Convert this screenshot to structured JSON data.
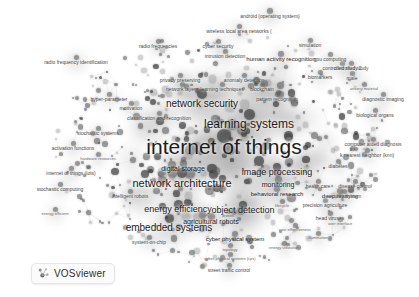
{
  "app": {
    "name": "VOSviewer",
    "logo_label": "VOSviewer",
    "logo_icon": "vosviewer-logo-icon",
    "background_color": "#ffffff",
    "node_color": "#5a5a5a",
    "label_color": "#1c1c1c"
  },
  "visualization": {
    "type": "term co-occurrence density network map",
    "layout": "force-directed cluster map",
    "colormap": "grayscale",
    "width": 419,
    "height": 297
  },
  "terms": [
    {
      "label": "internet of things",
      "x": 224,
      "y": 146,
      "size": 21,
      "weight": 100
    },
    {
      "label": "learning systems",
      "x": 249,
      "y": 124,
      "size": 12,
      "weight": 72
    },
    {
      "label": "network security",
      "x": 202,
      "y": 104,
      "size": 10,
      "weight": 60
    },
    {
      "label": "network architecture",
      "x": 182,
      "y": 183,
      "size": 11,
      "weight": 64
    },
    {
      "label": "embedded systems",
      "x": 169,
      "y": 228,
      "size": 10,
      "weight": 58
    },
    {
      "label": "energy efficiency",
      "x": 178,
      "y": 209,
      "size": 9,
      "weight": 52
    },
    {
      "label": "object detection",
      "x": 243,
      "y": 210,
      "size": 9,
      "weight": 50
    },
    {
      "label": "image processing",
      "x": 277,
      "y": 172,
      "size": 9,
      "weight": 49
    },
    {
      "label": "agricultural robots",
      "x": 211,
      "y": 221,
      "size": 7,
      "weight": 38
    },
    {
      "label": "digital storage",
      "x": 183,
      "y": 168,
      "size": 7,
      "weight": 36
    },
    {
      "label": "monitoring",
      "x": 278,
      "y": 184,
      "size": 7,
      "weight": 35
    },
    {
      "label": "behavioral research",
      "x": 277,
      "y": 194,
      "size": 6,
      "weight": 31
    },
    {
      "label": "deep learning",
      "x": 340,
      "y": 196,
      "size": 6,
      "weight": 30
    },
    {
      "label": "human activity recognition",
      "x": 281,
      "y": 59,
      "size": 6,
      "weight": 30
    },
    {
      "label": "cyber physical system",
      "x": 235,
      "y": 239,
      "size": 6,
      "weight": 29
    },
    {
      "label": "android (operating system)",
      "x": 270,
      "y": 16,
      "size": 5,
      "weight": 26
    },
    {
      "label": "wireless local area networks (",
      "x": 239,
      "y": 31,
      "size": 5,
      "weight": 25
    },
    {
      "label": "radio frequency identification",
      "x": 76,
      "y": 62,
      "size": 5,
      "weight": 25
    },
    {
      "label": "radio frequencies",
      "x": 158,
      "y": 46,
      "size": 5,
      "weight": 24
    },
    {
      "label": "cyber security",
      "x": 218,
      "y": 46,
      "size": 5,
      "weight": 23
    },
    {
      "label": "intrusion detection",
      "x": 225,
      "y": 56,
      "size": 5,
      "weight": 23
    },
    {
      "label": "simulation",
      "x": 310,
      "y": 45,
      "size": 5,
      "weight": 23
    },
    {
      "label": "controlled study",
      "x": 351,
      "y": 68,
      "size": 5,
      "weight": 23
    },
    {
      "label": "diagnostic imaging",
      "x": 383,
      "y": 99,
      "size": 5,
      "weight": 23
    },
    {
      "label": "computer aided diagnosis",
      "x": 373,
      "y": 144,
      "size": 5,
      "weight": 23
    },
    {
      "label": "k nearest neighbor (knn)",
      "x": 367,
      "y": 155,
      "size": 5,
      "weight": 22
    },
    {
      "label": "biological organs",
      "x": 375,
      "y": 115,
      "size": 5,
      "weight": 22
    },
    {
      "label": "biomarkers",
      "x": 320,
      "y": 77,
      "size": 5,
      "weight": 22
    },
    {
      "label": "male",
      "x": 352,
      "y": 78,
      "size": 5,
      "weight": 21
    },
    {
      "label": "diabetes",
      "x": 338,
      "y": 166,
      "size": 5,
      "weight": 22
    },
    {
      "label": "health care",
      "x": 318,
      "y": 186,
      "size": 5,
      "weight": 21
    },
    {
      "label": "disease control",
      "x": 355,
      "y": 186,
      "size": 5,
      "weight": 21
    },
    {
      "label": "precision agriculture",
      "x": 325,
      "y": 205,
      "size": 5,
      "weight": 21
    },
    {
      "label": "head viruses",
      "x": 330,
      "y": 218,
      "size": 5,
      "weight": 20
    },
    {
      "label": "hyper-parameter",
      "x": 109,
      "y": 99,
      "size": 5,
      "weight": 22
    },
    {
      "label": "privacy preserving",
      "x": 180,
      "y": 80,
      "size": 5,
      "weight": 22
    },
    {
      "label": "anomaly detection",
      "x": 244,
      "y": 80,
      "size": 5,
      "weight": 22
    },
    {
      "label": "network layers",
      "x": 182,
      "y": 89,
      "size": 5,
      "weight": 22
    },
    {
      "label": "learning techniques",
      "x": 222,
      "y": 89,
      "size": 5,
      "weight": 21
    },
    {
      "label": "blockchain",
      "x": 262,
      "y": 89,
      "size": 5,
      "weight": 21
    },
    {
      "label": "pattern recognition",
      "x": 277,
      "y": 99,
      "size": 5,
      "weight": 21
    },
    {
      "label": "gpu computing",
      "x": 330,
      "y": 59,
      "size": 5,
      "weight": 21
    },
    {
      "label": "controlled study 2",
      "x": 342,
      "y": 68,
      "size": 5,
      "weight": 20
    },
    {
      "label": "anxiety material",
      "x": 364,
      "y": 89,
      "size": 4,
      "weight": 19
    },
    {
      "label": "motivation",
      "x": 131,
      "y": 108,
      "size": 5,
      "weight": 21
    },
    {
      "label": "classification and recognition",
      "x": 159,
      "y": 118,
      "size": 5,
      "weight": 21
    },
    {
      "label": "stochastic systems",
      "x": 98,
      "y": 133,
      "size": 5,
      "weight": 21
    },
    {
      "label": "activation functions",
      "x": 73,
      "y": 148,
      "size": 5,
      "weight": 21
    },
    {
      "label": "hardware resources",
      "x": 98,
      "y": 159,
      "size": 4,
      "weight": 19
    },
    {
      "label": "internet of things (iots)",
      "x": 71,
      "y": 173,
      "size": 5,
      "weight": 21
    },
    {
      "label": "stochastic computing",
      "x": 60,
      "y": 189,
      "size": 5,
      "weight": 20
    },
    {
      "label": "intelligent robots",
      "x": 130,
      "y": 196,
      "size": 5,
      "weight": 21
    },
    {
      "label": "security system",
      "x": 344,
      "y": 196,
      "size": 5,
      "weight": 20
    },
    {
      "label": "drones",
      "x": 228,
      "y": 216,
      "size": 4,
      "weight": 19
    },
    {
      "label": "cost effectiveness",
      "x": 295,
      "y": 230,
      "size": 4,
      "weight": 19
    },
    {
      "label": "user interface",
      "x": 340,
      "y": 224,
      "size": 4,
      "weight": 18
    },
    {
      "label": "illumination",
      "x": 318,
      "y": 238,
      "size": 4,
      "weight": 18
    },
    {
      "label": "energy efficient",
      "x": 55,
      "y": 214,
      "size": 4,
      "weight": 19
    },
    {
      "label": "system-on-chip",
      "x": 149,
      "y": 242,
      "size": 5,
      "weight": 20
    },
    {
      "label": "topology",
      "x": 230,
      "y": 250,
      "size": 4,
      "weight": 19
    },
    {
      "label": "cyber-physical systems (cps)",
      "x": 230,
      "y": 259,
      "size": 4,
      "weight": 18
    },
    {
      "label": "street traffic control",
      "x": 229,
      "y": 270,
      "size": 5,
      "weight": 20
    },
    {
      "label": "energy utilization",
      "x": 284,
      "y": 248,
      "size": 4,
      "weight": 17
    },
    {
      "label": "lifecycle",
      "x": 282,
      "y": 206,
      "size": 4,
      "weight": 18
    }
  ]
}
